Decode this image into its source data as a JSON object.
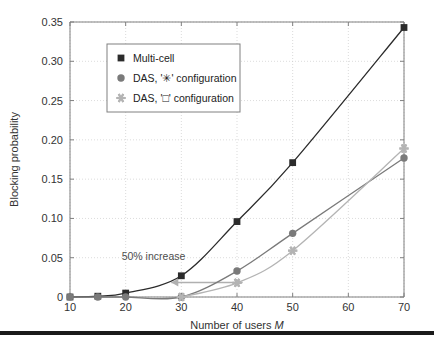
{
  "figure": {
    "background_color": "#ffffff",
    "axes_color": "#808080",
    "grid_color": "#cccccc",
    "bottom_rule_color": "#1a1a1a"
  },
  "chart_data": {
    "type": "line",
    "title": "",
    "xlabel_prefix": "Number of users ",
    "xlabel_symbol": "M",
    "ylabel": "Blocking probability",
    "xlim": [
      10,
      70
    ],
    "ylim": [
      0,
      0.35
    ],
    "xticks": [
      10,
      20,
      30,
      40,
      50,
      60,
      70
    ],
    "xticklabels": [
      "10",
      "20",
      "30",
      "40",
      "50",
      "60",
      "70"
    ],
    "yticks": [
      0,
      0.05,
      0.1,
      0.15,
      0.2,
      0.25,
      0.3,
      0.35
    ],
    "yticklabels": [
      "0",
      "0.05",
      "0.10",
      "0.15",
      "0.20",
      "0.25",
      "0.30",
      "0.35"
    ],
    "grid": true,
    "legend_position": "upper left",
    "series": [
      {
        "name": "Multi-cell",
        "marker": "square",
        "color": "#2b2b2b",
        "x": [
          10,
          15,
          20,
          30,
          40,
          50,
          70
        ],
        "values": [
          0.0,
          0.001,
          0.005,
          0.027,
          0.096,
          0.171,
          0.343
        ]
      },
      {
        "name": "DAS, '✳' configuration",
        "marker": "circle",
        "color": "#7a7a7a",
        "x": [
          10,
          15,
          20,
          30,
          40,
          50,
          70
        ],
        "values": [
          0.0,
          0.0,
          0.0,
          0.0,
          0.033,
          0.081,
          0.177
        ]
      },
      {
        "name": "DAS, '□' configuration",
        "marker": "star",
        "color": "#b4b4b4",
        "x": [
          30,
          40,
          50,
          70
        ],
        "values": [
          0.0,
          0.018,
          0.059,
          0.189
        ]
      }
    ],
    "annotations": [
      {
        "text": "50% increase",
        "x": 25.0,
        "y": 0.047,
        "color": "#4d4d4d"
      }
    ],
    "arrows": [
      {
        "name": "fifty-percent-increase-arrow",
        "x_start": 28.2,
        "x_end": 41.0,
        "y": 0.0185,
        "double_headed": true,
        "color": "#b0b0b0"
      }
    ]
  },
  "legend": {
    "entries": [
      {
        "label": "Multi-cell",
        "marker": "square",
        "color": "#2b2b2b"
      },
      {
        "label": "DAS, '✳' configuration",
        "marker": "circle",
        "color": "#7a7a7a"
      },
      {
        "label": "DAS, '□' configuration",
        "marker": "star",
        "color": "#b4b4b4"
      }
    ]
  }
}
